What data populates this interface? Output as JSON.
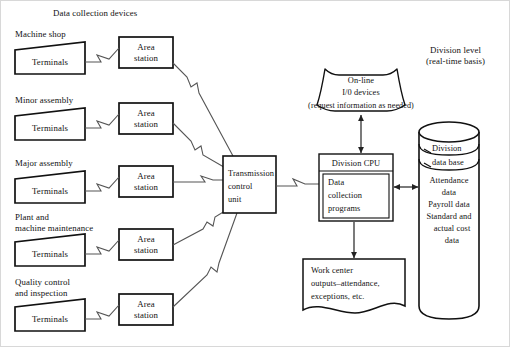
{
  "diagram": {
    "title_left": "Data collection devices",
    "title_right_line1": "Division level",
    "title_right_line2": "(real-time basis)",
    "groups": [
      {
        "label": "Machine shop",
        "terminal": "Terminals",
        "station_line1": "Area",
        "station_line2": "station"
      },
      {
        "label": "Minor assembly",
        "terminal": "Terminals",
        "station_line1": "Area",
        "station_line2": "station"
      },
      {
        "label": "Major assembly",
        "terminal": "Terminals",
        "station_line1": "Area",
        "station_line2": "station"
      },
      {
        "label_line1": "Plant and",
        "label_line2": "machine maintenance",
        "terminal": "Terminals",
        "station_line1": "Area",
        "station_line2": "station"
      },
      {
        "label_line1": "Quality control",
        "label_line2": "and inspection",
        "terminal": "Terminals",
        "station_line1": "Area",
        "station_line2": "station"
      }
    ],
    "transmission": {
      "line1": "Transmission",
      "line2": "control",
      "line3": "unit"
    },
    "cpu": {
      "header": "Division CPU",
      "body_line1": "Data",
      "body_line2": "collection",
      "body_line3": "programs"
    },
    "online_io": {
      "line1": "On-line",
      "line2": "I/0 devices",
      "line3": "(request information as needed)"
    },
    "database": {
      "title_line1": "Division",
      "title_line2": "data base",
      "items": [
        "Attendance",
        "data",
        "Payroll data",
        "Standard and",
        "actual cost",
        "data"
      ]
    },
    "outputs": {
      "line1": "Work center",
      "line2": "outputs–attendance,",
      "line3": "exceptions, etc."
    },
    "colors": {
      "stroke": "#111111",
      "line": "#555555",
      "background": "#ffffff",
      "frame": "#d8d8d8"
    }
  }
}
